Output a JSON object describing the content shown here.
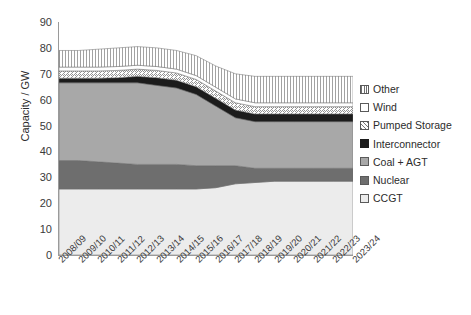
{
  "chart_data": {
    "type": "area",
    "title": "",
    "xlabel": "",
    "ylabel": "Capacity / GW",
    "ylim": [
      0,
      90
    ],
    "ytick_step": 10,
    "yticks": [
      90,
      80,
      70,
      60,
      50,
      40,
      30,
      20,
      10,
      0
    ],
    "grid": false,
    "stacked": true,
    "legend_position": "right",
    "categories": [
      "2008/09",
      "2009/10",
      "2010/11",
      "2011/12",
      "2012/13",
      "2013/14",
      "2014/15",
      "2015/16",
      "2016/17",
      "2017/18",
      "2018/19",
      "2019/20",
      "2020/21",
      "2021/22",
      "2022/23",
      "2023/24"
    ],
    "series": [
      {
        "name": "CCGT",
        "color": "#ececec",
        "pattern": "solid",
        "values": [
          25.5,
          25.5,
          25.5,
          25.5,
          25.5,
          25.5,
          25.5,
          25.5,
          26.0,
          27.5,
          28.0,
          28.5,
          28.5,
          28.5,
          28.5,
          28.5
        ]
      },
      {
        "name": "Nuclear",
        "color": "#6e6e6e",
        "pattern": "solid",
        "values": [
          11.0,
          11.0,
          10.5,
          10.0,
          9.5,
          9.5,
          9.5,
          9.0,
          8.5,
          7.0,
          5.5,
          5.0,
          5.0,
          5.0,
          5.0,
          5.0
        ]
      },
      {
        "name": "Coal + AGT",
        "color": "#a8a8a8",
        "pattern": "solid",
        "values": [
          30.0,
          30.0,
          30.5,
          31.0,
          31.5,
          30.5,
          29.5,
          27.5,
          23.0,
          18.5,
          18.0,
          18.0,
          18.0,
          18.0,
          18.0,
          18.0
        ]
      },
      {
        "name": "Interconnector",
        "color": "#1c1c1c",
        "pattern": "solid",
        "values": [
          1.8,
          1.8,
          1.8,
          2.0,
          2.5,
          3.0,
          3.0,
          3.0,
          3.0,
          3.0,
          3.0,
          3.0,
          3.0,
          3.0,
          3.0,
          3.0
        ]
      },
      {
        "name": "Pumped Storage",
        "color": "#ffffff",
        "pattern": "diagonal-hatch",
        "values": [
          2.8,
          2.8,
          2.8,
          2.8,
          2.8,
          2.8,
          2.8,
          2.8,
          2.8,
          2.8,
          2.8,
          2.8,
          2.8,
          2.8,
          2.8,
          2.8
        ]
      },
      {
        "name": "Wind",
        "color": "#ffffff",
        "pattern": "solid",
        "values": [
          1.5,
          1.5,
          1.5,
          1.5,
          1.5,
          1.5,
          1.5,
          1.5,
          1.5,
          1.5,
          1.5,
          1.5,
          1.5,
          1.5,
          1.5,
          1.5
        ]
      },
      {
        "name": "Other",
        "color": "#ffffff",
        "pattern": "vertical-hatch",
        "values": [
          6.4,
          6.4,
          6.9,
          7.2,
          7.2,
          7.2,
          7.2,
          7.7,
          8.2,
          9.7,
          10.2,
          10.2,
          10.2,
          10.2,
          10.2,
          10.2
        ]
      }
    ],
    "totals": [
      79.0,
      79.0,
      79.5,
      80.0,
      80.5,
      80.0,
      79.0,
      77.0,
      73.0,
      70.0,
      69.0,
      69.0,
      69.0,
      69.0,
      69.0,
      69.0
    ]
  },
  "legend": {
    "items": [
      {
        "label": "Other",
        "swatch": "sw-other"
      },
      {
        "label": "Wind",
        "swatch": "sw-wind"
      },
      {
        "label": "Pumped Storage",
        "swatch": "sw-pumped"
      },
      {
        "label": "Interconnector",
        "swatch": "sw-inter"
      },
      {
        "label": "Coal + AGT",
        "swatch": "sw-coal"
      },
      {
        "label": "Nuclear",
        "swatch": "sw-nuclear"
      },
      {
        "label": "CCGT",
        "swatch": "sw-ccgt"
      }
    ]
  }
}
